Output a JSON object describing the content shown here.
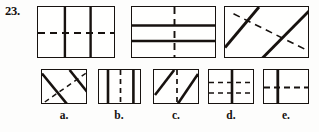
{
  "question": {
    "number_label": "23.",
    "type": "figure-analogy-multiple-choice"
  },
  "colors": {
    "ink": "#17120f",
    "paper": "#fdfdfc"
  },
  "prompt_figures": [
    {
      "id": "fig-1",
      "name": "prompt-figure-1",
      "description": "rectangle divided by two solid vertical lines and one dashed horizontal line",
      "solid_lines": [
        {
          "orientation": "vertical",
          "x1": 0.345,
          "y1": 0.0,
          "x2": 0.345,
          "y2": 1.0
        },
        {
          "orientation": "vertical",
          "x1": 0.675,
          "y1": 0.0,
          "x2": 0.675,
          "y2": 1.0
        }
      ],
      "dashed_lines": [
        {
          "orientation": "horizontal",
          "x1": 0.0,
          "y1": 0.5,
          "x2": 1.0,
          "y2": 0.5
        }
      ]
    },
    {
      "id": "fig-2",
      "name": "prompt-figure-2",
      "description": "rectangle divided by two solid horizontal lines and one dashed vertical line",
      "solid_lines": [
        {
          "orientation": "horizontal",
          "x1": 0.0,
          "y1": 0.355,
          "x2": 1.0,
          "y2": 0.355
        },
        {
          "orientation": "horizontal",
          "x1": 0.0,
          "y1": 0.655,
          "x2": 1.0,
          "y2": 0.655
        }
      ],
      "dashed_lines": [
        {
          "orientation": "vertical",
          "x1": 0.5,
          "y1": 0.0,
          "x2": 0.5,
          "y2": 1.0
        }
      ]
    },
    {
      "id": "fig-3",
      "name": "prompt-figure-3",
      "description": "rectangle crossed by two solid diagonals rising to the right and one dashed diagonal falling to the right",
      "solid_lines": [
        {
          "orientation": "diagonal-up",
          "x1": 0.0,
          "y1": 0.78,
          "x2": 0.4,
          "y2": 0.0
        },
        {
          "orientation": "diagonal-up",
          "x1": 0.43,
          "y1": 1.0,
          "x2": 1.0,
          "y2": 0.06
        }
      ],
      "dashed_lines": [
        {
          "orientation": "diagonal-down",
          "x1": 0.1,
          "y1": 0.13,
          "x2": 1.0,
          "y2": 0.86
        }
      ]
    }
  ],
  "options": [
    {
      "id": "fig-a",
      "letter": "a.",
      "name": "option-a",
      "description": "rectangle crossed by two solid diagonals falling to the right and one dashed diagonal rising to the right",
      "solid_lines": [
        {
          "orientation": "diagonal-down",
          "x1": 0.0,
          "y1": 0.1,
          "x2": 0.56,
          "y2": 1.0
        },
        {
          "orientation": "diagonal-down",
          "x1": 0.6,
          "y1": 0.0,
          "x2": 1.0,
          "y2": 0.66
        }
      ],
      "dashed_lines": [
        {
          "orientation": "diagonal-up",
          "x1": 0.06,
          "y1": 0.92,
          "x2": 1.0,
          "y2": 0.05
        }
      ]
    },
    {
      "id": "fig-b",
      "letter": "b.",
      "name": "option-b",
      "description": "rectangle divided by two solid vertical lines and one dashed vertical line between them",
      "solid_lines": [
        {
          "orientation": "vertical",
          "x1": 0.21,
          "y1": 0.0,
          "x2": 0.21,
          "y2": 1.0
        },
        {
          "orientation": "vertical",
          "x1": 0.8,
          "y1": 0.0,
          "x2": 0.8,
          "y2": 1.0
        }
      ],
      "dashed_lines": [
        {
          "orientation": "vertical",
          "x1": 0.5,
          "y1": 0.0,
          "x2": 0.5,
          "y2": 1.0
        }
      ]
    },
    {
      "id": "fig-c",
      "letter": "c.",
      "name": "option-c",
      "description": "rectangle with two solid diagonals rising to the right and one dashed vertical line in the middle",
      "solid_lines": [
        {
          "orientation": "diagonal-up",
          "x1": 0.02,
          "y1": 0.72,
          "x2": 0.44,
          "y2": 0.0
        },
        {
          "orientation": "diagonal-up",
          "x1": 0.5,
          "y1": 1.0,
          "x2": 0.96,
          "y2": 0.12
        }
      ],
      "dashed_lines": [
        {
          "orientation": "vertical",
          "x1": 0.5,
          "y1": 0.0,
          "x2": 0.5,
          "y2": 1.0
        }
      ]
    },
    {
      "id": "fig-d",
      "letter": "d.",
      "name": "option-d",
      "description": "rectangle with one solid vertical line in the middle and two dashed horizontal lines",
      "solid_lines": [
        {
          "orientation": "vertical",
          "x1": 0.5,
          "y1": 0.0,
          "x2": 0.5,
          "y2": 1.0
        }
      ],
      "dashed_lines": [
        {
          "orientation": "horizontal",
          "x1": 0.0,
          "y1": 0.36,
          "x2": 1.0,
          "y2": 0.36
        },
        {
          "orientation": "horizontal",
          "x1": 0.0,
          "y1": 0.66,
          "x2": 1.0,
          "y2": 0.66
        }
      ]
    },
    {
      "id": "fig-e",
      "letter": "e.",
      "name": "option-e",
      "description": "rectangle with one solid vertical line left of center and one dashed horizontal line",
      "solid_lines": [
        {
          "orientation": "vertical",
          "x1": 0.3,
          "y1": 0.0,
          "x2": 0.3,
          "y2": 1.0
        }
      ],
      "dashed_lines": [
        {
          "orientation": "horizontal",
          "x1": 0.0,
          "y1": 0.5,
          "x2": 1.0,
          "y2": 0.5
        }
      ]
    }
  ]
}
